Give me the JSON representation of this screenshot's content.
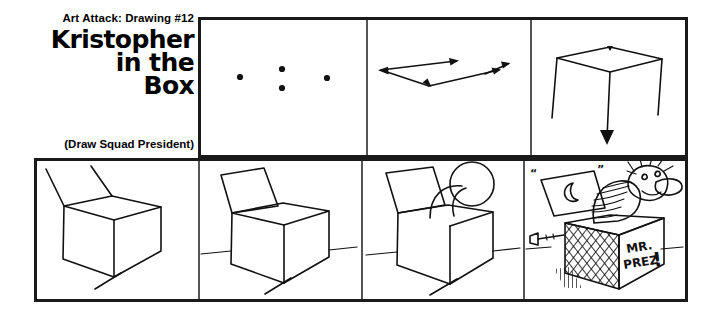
{
  "page": {
    "background_color": "#ffffff",
    "ink_color": "#111111",
    "frame_color": "#1a1a1a",
    "width": 722,
    "height": 317
  },
  "title_block": {
    "kicker": "Art Attack: Drawing #12",
    "title_line_1": "Kristopher",
    "title_line_2": "in the",
    "title_line_3": "Box",
    "subtitle": "(Draw Squad President)"
  },
  "top_row": {
    "panels": [
      {
        "index": 1,
        "name": "four-dots-panel",
        "caption": "",
        "description": "Four guide dots marking the corners of the box top"
      },
      {
        "index": 2,
        "name": "arrow-chevron-panel",
        "caption": "",
        "description": "Two arrow strokes forming a shallow V connecting the dots"
      },
      {
        "index": 3,
        "name": "box-top-drop-panel",
        "caption": "",
        "description": "Rhombus top with three vertical edges dropping down, center edge ends in a down arrow"
      }
    ]
  },
  "bottom_row": {
    "panels": [
      {
        "index": 1,
        "name": "cube-with-lid-lines-panel",
        "caption": "",
        "description": "Completed cube with two lid lines rising from the back edge"
      },
      {
        "index": 2,
        "name": "box-open-lid-panel",
        "caption": "",
        "description": "Box with open lid flap and a horizontal ground line"
      },
      {
        "index": 3,
        "name": "head-emerging-panel",
        "caption": "",
        "description": "Curved neck and round head popping out of the open box"
      },
      {
        "index": 4,
        "name": "finished-jack-in-the-box-panel",
        "caption": "",
        "description": "Finished jack-in-the-box character with crank, hatched box, moon on lid",
        "box_label_line_1": "MR.",
        "box_label_line_2": "PREZ",
        "box_label_exclaim": "!",
        "lid_motif": "crescent-moon",
        "quote_left": "“",
        "quote_right": "”"
      }
    ]
  }
}
